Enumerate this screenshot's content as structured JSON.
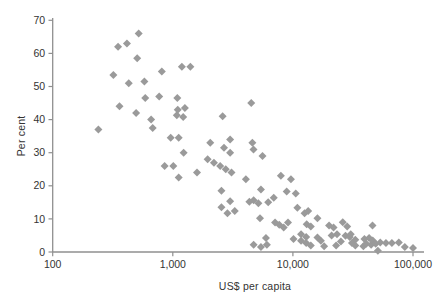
{
  "style": {
    "background": "#ffffff",
    "axis_color": "#8f8f8f",
    "text_color": "#333333",
    "marker_color": "#9a9a9a"
  },
  "chart_data": {
    "type": "scatter",
    "title": "",
    "xlabel": "US$ per capita",
    "ylabel": "Per cent",
    "x_scale": "log",
    "y_scale": "linear",
    "xlim": [
      100,
      126000
    ],
    "ylim": [
      0,
      70
    ],
    "grid": false,
    "legend": null,
    "x_ticks": [
      100,
      1000,
      10000,
      100000
    ],
    "x_tick_labels": [
      "100",
      "1,000",
      "10,000",
      "100,000"
    ],
    "y_ticks": [
      0,
      10,
      20,
      30,
      40,
      50,
      60,
      70
    ],
    "y_tick_labels": [
      "0",
      "10",
      "20",
      "30",
      "40",
      "50",
      "60",
      "70"
    ],
    "marker": {
      "shape": "diamond",
      "size": 8,
      "color": "#9a9a9a"
    },
    "points": [
      [
        240,
        37
      ],
      [
        320,
        53.5
      ],
      [
        350,
        62
      ],
      [
        360,
        44
      ],
      [
        415,
        63
      ],
      [
        430,
        51
      ],
      [
        495,
        42
      ],
      [
        505,
        58.5
      ],
      [
        520,
        66
      ],
      [
        580,
        51.5
      ],
      [
        590,
        46.5
      ],
      [
        660,
        40
      ],
      [
        680,
        37.5
      ],
      [
        770,
        47
      ],
      [
        810,
        54.5
      ],
      [
        855,
        26
      ],
      [
        960,
        34.5
      ],
      [
        1010,
        26
      ],
      [
        1080,
        41.3
      ],
      [
        1090,
        46.5
      ],
      [
        1100,
        43
      ],
      [
        1120,
        34.5
      ],
      [
        1120,
        22.5
      ],
      [
        1190,
        56
      ],
      [
        1220,
        40.8
      ],
      [
        1230,
        30
      ],
      [
        1260,
        43.5
      ],
      [
        1400,
        56
      ],
      [
        1590,
        24
      ],
      [
        1950,
        28
      ],
      [
        2050,
        33
      ],
      [
        2200,
        27
      ],
      [
        2480,
        26
      ],
      [
        2540,
        18.5
      ],
      [
        2540,
        13.5
      ],
      [
        2600,
        41
      ],
      [
        2670,
        31.5
      ],
      [
        2760,
        25
      ],
      [
        2850,
        11.7
      ],
      [
        3000,
        34
      ],
      [
        3000,
        30
      ],
      [
        3000,
        15.3
      ],
      [
        3080,
        24
      ],
      [
        3280,
        12.4
      ],
      [
        4060,
        22
      ],
      [
        4340,
        15.2
      ],
      [
        4500,
        45
      ],
      [
        4600,
        33
      ],
      [
        4700,
        31
      ],
      [
        4710,
        15.6
      ],
      [
        4710,
        2.2
      ],
      [
        5160,
        14.7
      ],
      [
        5320,
        10.2
      ],
      [
        5420,
        18.9
      ],
      [
        5420,
        1.5
      ],
      [
        5580,
        29
      ],
      [
        5960,
        4.2
      ],
      [
        6070,
        2.2
      ],
      [
        6230,
        15
      ],
      [
        6930,
        16.4
      ],
      [
        7100,
        8.9
      ],
      [
        7700,
        8.2
      ],
      [
        7940,
        23
      ],
      [
        8380,
        7.4
      ],
      [
        8880,
        18.3
      ],
      [
        9100,
        8.9
      ],
      [
        9630,
        22
      ],
      [
        10120,
        3.9
      ],
      [
        10560,
        17.7
      ],
      [
        10900,
        13.4
      ],
      [
        11700,
        5.4
      ],
      [
        11700,
        3.4
      ],
      [
        12500,
        11.7
      ],
      [
        12900,
        4.5
      ],
      [
        12900,
        2.7
      ],
      [
        13030,
        8.4
      ],
      [
        13400,
        12.4
      ],
      [
        14100,
        7.7
      ],
      [
        14100,
        2
      ],
      [
        16000,
        10.2
      ],
      [
        16000,
        4.4
      ],
      [
        17100,
        3.4
      ],
      [
        18200,
        1.7
      ],
      [
        20000,
        8
      ],
      [
        21000,
        5
      ],
      [
        21800,
        7.4
      ],
      [
        22900,
        2
      ],
      [
        23300,
        5.4
      ],
      [
        25100,
        3.2
      ],
      [
        26000,
        9
      ],
      [
        27400,
        4.9
      ],
      [
        28300,
        7.7
      ],
      [
        29700,
        4.5
      ],
      [
        30300,
        5.4
      ],
      [
        31000,
        2.7
      ],
      [
        33100,
        3.7
      ],
      [
        33100,
        2
      ],
      [
        38600,
        1.7
      ],
      [
        39400,
        3.9
      ],
      [
        40800,
        2.5
      ],
      [
        43100,
        4.2
      ],
      [
        44800,
        2.2
      ],
      [
        46000,
        8
      ],
      [
        46200,
        3.5
      ],
      [
        48900,
        2.5
      ],
      [
        51000,
        0.4
      ],
      [
        53400,
        2.9
      ],
      [
        59500,
        2.7
      ],
      [
        66700,
        2.7
      ],
      [
        76200,
        2.9
      ],
      [
        85500,
        1.5
      ],
      [
        100000,
        1.2
      ]
    ]
  }
}
